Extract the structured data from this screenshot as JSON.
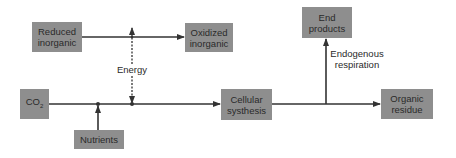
{
  "diagram": {
    "nodes": {
      "reduced_inorganic": {
        "label": "Reduced\ninorganic"
      },
      "oxidized_inorganic": {
        "label": "Oxidized\ninorganic"
      },
      "end_products": {
        "label": "End\nproducts"
      },
      "co2": {
        "label": "CO",
        "subscript": "2"
      },
      "nutrients": {
        "label": "Nutrients"
      },
      "cellular_synthesis": {
        "label": "Cellular\nsysthesis"
      },
      "organic_residue": {
        "label": "Organic\nresidue"
      }
    },
    "labels": {
      "energy": "Energy",
      "endogenous_respiration": "Endogenous\nrespiration"
    },
    "edges": [
      {
        "from": "Reduced inorganic",
        "to": "Oxidized inorganic",
        "style": "solid"
      },
      {
        "from": "Energy junction",
        "to": "Reduced/Oxidized line",
        "style": "dotted",
        "label": "Energy"
      },
      {
        "from": "Energy junction",
        "to": "Main line",
        "style": "dotted"
      },
      {
        "from": "CO2",
        "to": "Cellular synthesis",
        "style": "solid"
      },
      {
        "from": "Nutrients",
        "to": "Main line",
        "style": "solid"
      },
      {
        "from": "Cellular synthesis",
        "to": "Organic residue",
        "style": "solid"
      },
      {
        "from": "Cellular synthesis line",
        "to": "End products",
        "style": "solid",
        "label": "Endogenous respiration"
      }
    ],
    "colors": {
      "box_fill": "#8e8e8e",
      "text": "#2a2a2a",
      "line": "#333333",
      "background": "#ffffff"
    }
  }
}
